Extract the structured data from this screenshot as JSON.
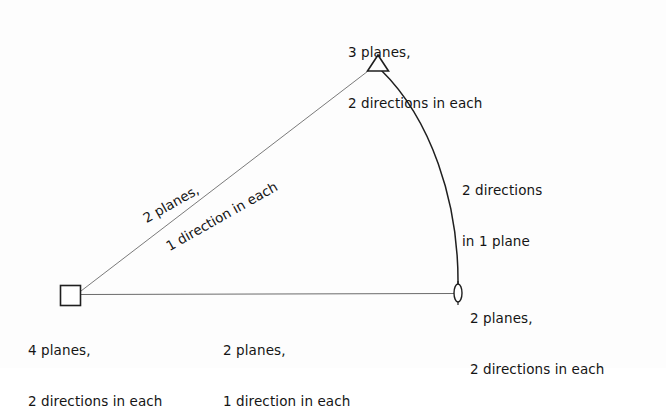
{
  "figure": {
    "kind": "crystal-symmetry-diagram",
    "background_color": "#fdfdfd",
    "line_color": "#555555",
    "arc_color": "#1a1a1a",
    "text_color": "#151515",
    "nodes": [
      {
        "id": "square-node",
        "marker": "square",
        "x": 70,
        "y": 295,
        "label_lines": [
          "4 planes,",
          "2 directions in each"
        ]
      },
      {
        "id": "triangle-node",
        "marker": "triangle",
        "x": 378,
        "y": 64,
        "label_lines": [
          "3 planes,",
          "2 directions in each"
        ]
      },
      {
        "id": "lens-node",
        "marker": "vertical-lens",
        "x": 458,
        "y": 293,
        "label_lines": [
          "2 planes,",
          "2 directions in each"
        ]
      }
    ],
    "edges": [
      {
        "id": "diagonal-edge",
        "from": "square-node",
        "to": "triangle-node",
        "style": "straight",
        "label_lines": [
          "2 planes,",
          "1 direction in each"
        ],
        "label_rotation_deg": -29.5
      },
      {
        "id": "bottom-edge",
        "from": "square-node",
        "to": "lens-node",
        "style": "straight",
        "label_lines": [
          "2 planes,",
          "1 direction in each"
        ]
      },
      {
        "id": "arc-edge",
        "from": "triangle-node",
        "to": "lens-node",
        "style": "curved",
        "label_lines": [
          "2 directions",
          "in 1 plane"
        ]
      }
    ]
  },
  "labels": {
    "apex": {
      "line1": "3 planes,",
      "line2": "2 directions in each"
    },
    "bottom_left": {
      "line1": "4 planes,",
      "line2": "2 directions in each"
    },
    "bottom_center": {
      "line1": "2 planes,",
      "line2": "1 direction in each"
    },
    "bottom_right": {
      "line1": "2 planes,",
      "line2": "2 directions in each"
    },
    "right": {
      "line1": "2 directions",
      "line2": "in 1 plane"
    },
    "diagonal": {
      "line1": "2 planes,",
      "line2": "1 direction in each"
    }
  }
}
